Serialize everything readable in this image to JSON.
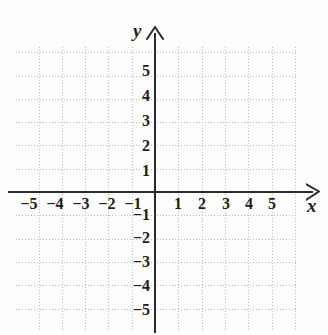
{
  "figure": {
    "kind": "cartesian-coordinate-plane",
    "background_color": "#fdfdfd",
    "grid_color": "#bdbdbd",
    "axis_color": "#2b2b2b"
  },
  "axes": {
    "x_label": "x",
    "y_label": "y",
    "x_arrow": "arrow-right",
    "y_arrow": "arrow-up"
  },
  "chart_data": {
    "type": "scatter",
    "title": "",
    "xlabel": "x",
    "ylabel": "y",
    "xlim": [
      -6,
      6
    ],
    "ylim": [
      -6,
      6
    ],
    "grid": true,
    "grid_style": "dotted",
    "legend": false,
    "series": [],
    "x_ticks": [
      -5,
      -4,
      -3,
      -2,
      -1,
      1,
      2,
      3,
      4,
      5
    ],
    "y_ticks": [
      5,
      4,
      3,
      2,
      1,
      -1,
      -2,
      -3,
      -4,
      -5
    ],
    "x_tick_labels": [
      "−5",
      "−4",
      "−3",
      "−2",
      "−1",
      "1",
      "2",
      "3",
      "4",
      "5"
    ],
    "y_tick_labels": [
      "5",
      "4",
      "3",
      "2",
      "1",
      "−1",
      "−2",
      "−3",
      "−4",
      "−5"
    ]
  },
  "ticks": {
    "x_negative": [
      {
        "label": "−5"
      },
      {
        "label": "−4"
      },
      {
        "label": "−3"
      },
      {
        "label": "−2"
      },
      {
        "label": "−1"
      }
    ],
    "x_positive": [
      {
        "label": "1"
      },
      {
        "label": "2"
      },
      {
        "label": "3"
      },
      {
        "label": "4"
      },
      {
        "label": "5"
      }
    ],
    "y_positive": [
      {
        "label": "5"
      },
      {
        "label": "4"
      },
      {
        "label": "3"
      },
      {
        "label": "2"
      },
      {
        "label": "1"
      }
    ],
    "y_negative": [
      {
        "label": "−1"
      },
      {
        "label": "−2"
      },
      {
        "label": "−3"
      },
      {
        "label": "−4"
      },
      {
        "label": "−5"
      }
    ]
  }
}
